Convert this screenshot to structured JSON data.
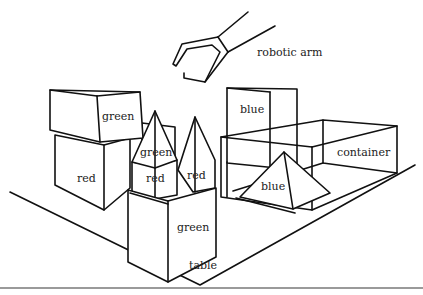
{
  "diagram": {
    "type": "blocks-world-scene",
    "labels": {
      "robotic_arm": "robotic arm",
      "green_block_top": "green",
      "red_block_left": "red",
      "green_pyramid": "green",
      "red_block_small": "red",
      "red_pyramid": "red",
      "blue_block": "blue",
      "container": "container",
      "blue_pyramid": "blue",
      "green_block_front": "green",
      "table": "table"
    },
    "stroke_color": "#111111",
    "background_color": "#ffffff"
  }
}
